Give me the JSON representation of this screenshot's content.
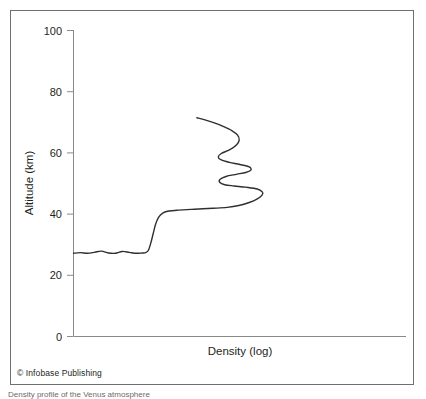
{
  "figure": {
    "credit": "© Infobase Publishing",
    "caption_partial": "Density profile of the Venus atmosphere"
  },
  "chart_data": {
    "type": "line",
    "title": "",
    "subtitle": "",
    "xlabel": "Density (log)",
    "ylabel": "Altitude (km)",
    "x_tick_labels": [],
    "y_tick_labels": [
      "0",
      "20",
      "40",
      "60",
      "80",
      "100"
    ],
    "y_ticks": [
      0,
      20,
      40,
      60,
      80,
      100
    ],
    "ylim": [
      0,
      100
    ],
    "xlim": [
      0,
      10
    ],
    "grid": false,
    "legend": null,
    "x_axis_note": "logarithmic density axis, unlabeled ticks",
    "series": [
      {
        "name": "Density profile",
        "line_color": "#2f2f2f",
        "line_width": 1.4,
        "comment": "x values are arbitrary log-density units (0-10 across plot width); y values are altitude in km. Curve traced from plot: starts at left axis ~27 km, nearly flat with small ripples, rises steeply near x=3.2 to ~41 km, extends right along ~41-42 km, then a series of back-and-forth oscillations (folds) between ~45 and ~72 km.",
        "points": [
          {
            "x": 0.0,
            "y": 27.2
          },
          {
            "x": 0.3,
            "y": 27.4
          },
          {
            "x": 0.6,
            "y": 27.2
          },
          {
            "x": 0.9,
            "y": 27.5
          },
          {
            "x": 1.2,
            "y": 27.9
          },
          {
            "x": 1.5,
            "y": 27.3
          },
          {
            "x": 1.8,
            "y": 27.2
          },
          {
            "x": 2.1,
            "y": 27.8
          },
          {
            "x": 2.4,
            "y": 27.5
          },
          {
            "x": 2.7,
            "y": 27.2
          },
          {
            "x": 2.95,
            "y": 27.3
          },
          {
            "x": 3.1,
            "y": 27.4
          },
          {
            "x": 3.22,
            "y": 28.2
          },
          {
            "x": 3.32,
            "y": 30.5
          },
          {
            "x": 3.42,
            "y": 33.5
          },
          {
            "x": 3.52,
            "y": 36.5
          },
          {
            "x": 3.66,
            "y": 39.0
          },
          {
            "x": 3.85,
            "y": 40.4
          },
          {
            "x": 4.1,
            "y": 41.0
          },
          {
            "x": 4.5,
            "y": 41.3
          },
          {
            "x": 5.2,
            "y": 41.6
          },
          {
            "x": 6.0,
            "y": 41.9
          },
          {
            "x": 6.6,
            "y": 42.2
          },
          {
            "x": 7.1,
            "y": 42.8
          },
          {
            "x": 7.55,
            "y": 43.8
          },
          {
            "x": 7.9,
            "y": 45.0
          },
          {
            "x": 8.1,
            "y": 46.2
          },
          {
            "x": 8.12,
            "y": 47.2
          },
          {
            "x": 7.9,
            "y": 48.2
          },
          {
            "x": 7.4,
            "y": 48.8
          },
          {
            "x": 6.9,
            "y": 49.2
          },
          {
            "x": 6.5,
            "y": 49.6
          },
          {
            "x": 6.28,
            "y": 50.4
          },
          {
            "x": 6.3,
            "y": 51.4
          },
          {
            "x": 6.55,
            "y": 52.3
          },
          {
            "x": 7.0,
            "y": 53.0
          },
          {
            "x": 7.4,
            "y": 53.6
          },
          {
            "x": 7.62,
            "y": 54.4
          },
          {
            "x": 7.55,
            "y": 55.4
          },
          {
            "x": 7.15,
            "y": 56.2
          },
          {
            "x": 6.7,
            "y": 56.9
          },
          {
            "x": 6.35,
            "y": 57.7
          },
          {
            "x": 6.22,
            "y": 58.7
          },
          {
            "x": 6.35,
            "y": 59.8
          },
          {
            "x": 6.7,
            "y": 61.0
          },
          {
            "x": 7.0,
            "y": 62.6
          },
          {
            "x": 7.12,
            "y": 64.2
          },
          {
            "x": 7.05,
            "y": 65.8
          },
          {
            "x": 6.8,
            "y": 67.3
          },
          {
            "x": 6.45,
            "y": 68.6
          },
          {
            "x": 6.05,
            "y": 69.8
          },
          {
            "x": 5.65,
            "y": 70.8
          },
          {
            "x": 5.3,
            "y": 71.5
          }
        ]
      }
    ]
  },
  "axes": {
    "y_axis_color": "#8a8a8a",
    "x_axis_color": "#8a8a8a",
    "tick_color": "#8a8a8a",
    "curve_color": "#2f2f2f"
  }
}
